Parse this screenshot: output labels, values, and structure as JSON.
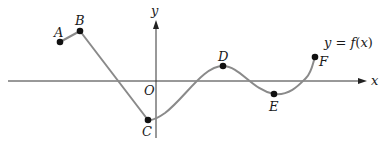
{
  "diagram": {
    "type": "function-graph",
    "axes": {
      "x_label": "x",
      "y_label": "y",
      "origin_label": "O",
      "color": "#333333"
    },
    "curve": {
      "label": "y = f(x)",
      "label_parts": {
        "y": "y",
        "eq": " = ",
        "f": "f",
        "paren_open": "(",
        "x": "x",
        "paren_close": ")"
      },
      "color": "#888888"
    },
    "points": [
      {
        "name": "A",
        "px": 60,
        "py": 42
      },
      {
        "name": "B",
        "px": 80,
        "py": 31
      },
      {
        "name": "C",
        "px": 148,
        "py": 120
      },
      {
        "name": "D",
        "px": 223,
        "py": 66
      },
      {
        "name": "E",
        "px": 274,
        "py": 94
      },
      {
        "name": "F",
        "px": 315,
        "py": 57
      }
    ],
    "labels": {
      "A": "A",
      "B": "B",
      "C": "C",
      "D": "D",
      "E": "E",
      "F": "F"
    },
    "point_color": "#111111"
  }
}
